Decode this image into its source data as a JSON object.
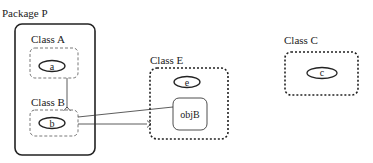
{
  "diagram": {
    "package": {
      "label": "Package P"
    },
    "classes": [
      {
        "id": "A",
        "label": "Class A",
        "objects": [
          "a"
        ]
      },
      {
        "id": "B",
        "label": "Class B",
        "objects": [
          "b"
        ]
      },
      {
        "id": "E",
        "label": "Class E",
        "objects": [
          "e",
          "objB"
        ]
      },
      {
        "id": "C",
        "label": "Class C",
        "objects": [
          "c"
        ]
      }
    ],
    "objects": {
      "a": "a",
      "b": "b",
      "e": "e",
      "objB": "objB",
      "c": "c"
    }
  }
}
